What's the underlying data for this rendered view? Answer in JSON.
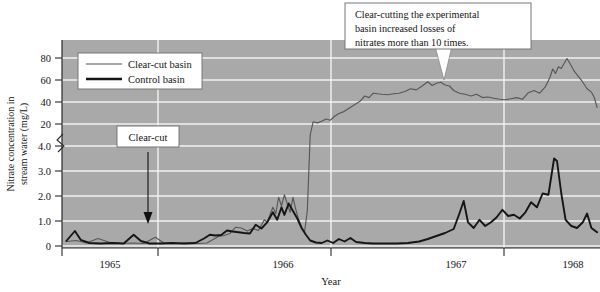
{
  "chart_data": {
    "type": "line",
    "title": "",
    "xlabel": "Year",
    "ylabel_line1": "Nitrate concentration in",
    "ylabel_line2": "stream water (mg/L)",
    "x_tick_labels": [
      "1965",
      "1966",
      "1967",
      "1968"
    ],
    "x_tick_values": [
      1965,
      1966,
      1967,
      1968
    ],
    "xlim": [
      1964.45,
      1968.2
    ],
    "y_tick_labels": [
      "0",
      "1.0",
      "2.0",
      "3.0",
      "4.0",
      "20",
      "40",
      "60",
      "80"
    ],
    "y_tick_values": [
      0,
      1.0,
      2.0,
      3.0,
      4.0,
      20,
      40,
      60,
      80
    ],
    "y_axis_note": "broken axis: linear 0-4 on lower segment, 4-90 compressed on upper segment",
    "ylim": [
      0,
      90
    ],
    "grid": true,
    "plot_background": "#a9a9a9",
    "gridline_color": "#f2f2f2",
    "legend_position": "top-left-inside",
    "series": [
      {
        "name": "Clear-cut basin",
        "color": "#575757",
        "linewidth": "thin",
        "points": [
          [
            1964.48,
            0.18
          ],
          [
            1964.55,
            0.22
          ],
          [
            1964.62,
            0.12
          ],
          [
            1964.7,
            0.3
          ],
          [
            1964.78,
            0.15
          ],
          [
            1964.86,
            0.1
          ],
          [
            1964.94,
            0.12
          ],
          [
            1965.02,
            0.1
          ],
          [
            1965.1,
            0.35
          ],
          [
            1965.16,
            0.12
          ],
          [
            1965.24,
            0.1
          ],
          [
            1965.32,
            0.12
          ],
          [
            1965.4,
            0.1
          ],
          [
            1965.46,
            0.12
          ],
          [
            1965.54,
            0.38
          ],
          [
            1965.58,
            0.42
          ],
          [
            1965.62,
            0.5
          ],
          [
            1965.66,
            0.75
          ],
          [
            1965.7,
            0.72
          ],
          [
            1965.74,
            0.6
          ],
          [
            1965.78,
            0.7
          ],
          [
            1965.82,
            0.62
          ],
          [
            1965.86,
            1.05
          ],
          [
            1965.88,
            0.95
          ],
          [
            1965.9,
            1.25
          ],
          [
            1965.92,
            1.55
          ],
          [
            1965.94,
            1.3
          ],
          [
            1965.96,
            1.95
          ],
          [
            1965.98,
            1.6
          ],
          [
            1966.0,
            2.05
          ],
          [
            1966.02,
            1.7
          ],
          [
            1966.04,
            1.35
          ],
          [
            1966.06,
            1.95
          ],
          [
            1966.08,
            1.45
          ],
          [
            1966.1,
            1.05
          ],
          [
            1966.12,
            0.75
          ],
          [
            1966.14,
            0.55
          ],
          [
            1966.16,
            1.4
          ],
          [
            1966.18,
            12.0
          ],
          [
            1966.2,
            22.0
          ],
          [
            1966.23,
            21.0
          ],
          [
            1966.26,
            22.5
          ],
          [
            1966.29,
            24.5
          ],
          [
            1966.32,
            23.5
          ],
          [
            1966.35,
            27.0
          ],
          [
            1966.38,
            29.5
          ],
          [
            1966.41,
            31.0
          ],
          [
            1966.44,
            33.5
          ],
          [
            1966.47,
            36.0
          ],
          [
            1966.5,
            38.5
          ],
          [
            1966.53,
            41.0
          ],
          [
            1966.56,
            45.5
          ],
          [
            1966.59,
            44.0
          ],
          [
            1966.62,
            48.0
          ],
          [
            1966.65,
            47.5
          ],
          [
            1966.68,
            47.0
          ],
          [
            1966.72,
            46.5
          ],
          [
            1966.76,
            47.5
          ],
          [
            1966.8,
            48.0
          ],
          [
            1966.84,
            49.5
          ],
          [
            1966.88,
            52.0
          ],
          [
            1966.92,
            51.0
          ],
          [
            1966.96,
            54.5
          ],
          [
            1967.0,
            58.5
          ],
          [
            1967.03,
            55.0
          ],
          [
            1967.06,
            57.0
          ],
          [
            1967.09,
            58.0
          ],
          [
            1967.12,
            55.5
          ],
          [
            1967.15,
            54.5
          ],
          [
            1967.18,
            50.5
          ],
          [
            1967.22,
            48.0
          ],
          [
            1967.26,
            47.0
          ],
          [
            1967.3,
            45.5
          ],
          [
            1967.34,
            47.0
          ],
          [
            1967.38,
            44.0
          ],
          [
            1967.42,
            44.5
          ],
          [
            1967.46,
            43.5
          ],
          [
            1967.5,
            42.5
          ],
          [
            1967.54,
            42.0
          ],
          [
            1967.58,
            43.0
          ],
          [
            1967.62,
            44.0
          ],
          [
            1967.66,
            42.5
          ],
          [
            1967.7,
            48.5
          ],
          [
            1967.74,
            50.5
          ],
          [
            1967.78,
            48.0
          ],
          [
            1967.82,
            54.0
          ],
          [
            1967.85,
            62.0
          ],
          [
            1967.87,
            70.0
          ],
          [
            1967.89,
            66.0
          ],
          [
            1967.91,
            72.0
          ],
          [
            1967.93,
            70.5
          ],
          [
            1967.95,
            75.0
          ],
          [
            1967.97,
            79.5
          ],
          [
            1968.0,
            73.0
          ],
          [
            1968.02,
            68.0
          ],
          [
            1968.05,
            63.0
          ],
          [
            1968.08,
            58.0
          ],
          [
            1968.11,
            52.0
          ],
          [
            1968.14,
            49.0
          ],
          [
            1968.16,
            44.0
          ],
          [
            1968.18,
            35.0
          ]
        ]
      },
      {
        "name": "Control basin",
        "color": "#151515",
        "linewidth": "thick",
        "points": [
          [
            1964.48,
            0.2
          ],
          [
            1964.54,
            0.6
          ],
          [
            1964.58,
            0.25
          ],
          [
            1964.64,
            0.12
          ],
          [
            1964.72,
            0.1
          ],
          [
            1964.8,
            0.12
          ],
          [
            1964.88,
            0.1
          ],
          [
            1964.95,
            0.45
          ],
          [
            1965.0,
            0.2
          ],
          [
            1965.06,
            0.1
          ],
          [
            1965.14,
            0.1
          ],
          [
            1965.22,
            0.12
          ],
          [
            1965.3,
            0.1
          ],
          [
            1965.38,
            0.12
          ],
          [
            1965.44,
            0.3
          ],
          [
            1965.48,
            0.45
          ],
          [
            1965.52,
            0.42
          ],
          [
            1965.56,
            0.44
          ],
          [
            1965.6,
            0.62
          ],
          [
            1965.64,
            0.58
          ],
          [
            1965.68,
            0.55
          ],
          [
            1965.72,
            0.52
          ],
          [
            1965.76,
            0.5
          ],
          [
            1965.8,
            0.85
          ],
          [
            1965.84,
            0.7
          ],
          [
            1965.88,
            0.95
          ],
          [
            1965.92,
            1.35
          ],
          [
            1965.95,
            1.05
          ],
          [
            1965.98,
            1.55
          ],
          [
            1966.0,
            1.25
          ],
          [
            1966.03,
            1.7
          ],
          [
            1966.06,
            1.4
          ],
          [
            1966.09,
            1.1
          ],
          [
            1966.12,
            0.72
          ],
          [
            1966.15,
            0.45
          ],
          [
            1966.18,
            0.22
          ],
          [
            1966.22,
            0.14
          ],
          [
            1966.26,
            0.12
          ],
          [
            1966.3,
            0.22
          ],
          [
            1966.34,
            0.12
          ],
          [
            1966.38,
            0.28
          ],
          [
            1966.42,
            0.18
          ],
          [
            1966.46,
            0.32
          ],
          [
            1966.5,
            0.16
          ],
          [
            1966.56,
            0.12
          ],
          [
            1966.62,
            0.1
          ],
          [
            1966.7,
            0.1
          ],
          [
            1966.78,
            0.1
          ],
          [
            1966.86,
            0.12
          ],
          [
            1966.94,
            0.18
          ],
          [
            1967.0,
            0.28
          ],
          [
            1967.06,
            0.4
          ],
          [
            1967.12,
            0.52
          ],
          [
            1967.18,
            0.68
          ],
          [
            1967.22,
            1.3
          ],
          [
            1967.25,
            1.8
          ],
          [
            1967.28,
            0.95
          ],
          [
            1967.32,
            0.72
          ],
          [
            1967.36,
            1.05
          ],
          [
            1967.4,
            0.8
          ],
          [
            1967.44,
            0.95
          ],
          [
            1967.48,
            1.15
          ],
          [
            1967.52,
            1.45
          ],
          [
            1967.56,
            1.2
          ],
          [
            1967.6,
            1.25
          ],
          [
            1967.64,
            1.1
          ],
          [
            1967.68,
            1.35
          ],
          [
            1967.72,
            1.75
          ],
          [
            1967.76,
            1.55
          ],
          [
            1967.8,
            2.1
          ],
          [
            1967.84,
            2.05
          ],
          [
            1967.88,
            3.5
          ],
          [
            1967.9,
            3.4
          ],
          [
            1967.93,
            2.1
          ],
          [
            1967.96,
            1.05
          ],
          [
            1968.0,
            0.8
          ],
          [
            1968.04,
            0.72
          ],
          [
            1968.08,
            0.95
          ],
          [
            1968.11,
            1.3
          ],
          [
            1968.14,
            0.72
          ],
          [
            1968.18,
            0.55
          ]
        ]
      }
    ],
    "annotations": [
      {
        "id": "callout-clearcutting",
        "lines": [
          "Clear-cutting the experimental",
          "basin increased losses of",
          "nitrates more than 10 times."
        ],
        "points_to": "clear-cut basin curve near 1967.7"
      },
      {
        "id": "annotation-clearcut-event",
        "label": "Clear-cut",
        "arrow": "down",
        "points_to": "x = late 1965 (clear-cutting event)"
      }
    ]
  },
  "legend": {
    "items": [
      {
        "label": "Clear-cut basin",
        "color": "#575757",
        "style": "thin"
      },
      {
        "label": "Control basin",
        "color": "#151515",
        "style": "thick"
      }
    ]
  }
}
